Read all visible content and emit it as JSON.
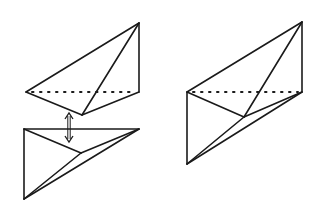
{
  "diagram": {
    "stroke_color": "#1a1a1a",
    "background": "#ffffff",
    "left_top_piece": {
      "vertices": {
        "apex": [
          139,
          23
        ],
        "left": [
          26,
          92
        ],
        "right": [
          139,
          92
        ],
        "bottom": [
          82,
          115
        ]
      },
      "solid_edges": [
        [
          "left",
          "apex"
        ],
        [
          "apex",
          "right"
        ],
        [
          "apex",
          "bottom"
        ],
        [
          "left",
          "bottom"
        ],
        [
          "bottom",
          "right"
        ]
      ],
      "hidden_edges": [
        [
          "left",
          "right"
        ]
      ]
    },
    "arrow": {
      "x": 69,
      "y1": 113,
      "y2": 142,
      "type": "double"
    },
    "left_bottom_piece": {
      "vertices": {
        "top_left": [
          24,
          129
        ],
        "top_right": [
          139,
          129
        ],
        "bottom": [
          24,
          199
        ],
        "inner": [
          81,
          153
        ]
      },
      "solid_edges": [
        [
          "top_left",
          "top_right"
        ],
        [
          "top_left",
          "bottom"
        ],
        [
          "bottom",
          "top_right"
        ],
        [
          "top_left",
          "inner"
        ],
        [
          "inner",
          "top_right"
        ],
        [
          "bottom",
          "inner"
        ]
      ]
    },
    "right_assembled": {
      "vertices": {
        "apex": [
          302,
          22
        ],
        "left": [
          187,
          92
        ],
        "right": [
          302,
          92
        ],
        "middle": [
          244,
          117
        ],
        "bottom": [
          187,
          164
        ]
      },
      "solid_edges": [
        [
          "left",
          "apex"
        ],
        [
          "apex",
          "right"
        ],
        [
          "apex",
          "middle"
        ],
        [
          "left",
          "middle"
        ],
        [
          "middle",
          "right"
        ],
        [
          "left",
          "bottom"
        ],
        [
          "bottom",
          "right"
        ],
        [
          "bottom",
          "middle"
        ]
      ],
      "hidden_edges": [
        [
          "left",
          "right"
        ]
      ]
    }
  }
}
